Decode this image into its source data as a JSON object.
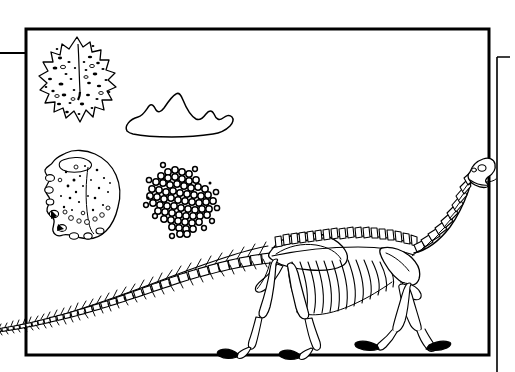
{
  "page": {
    "kind": "scientific-line-illustration",
    "background_color": "#ffffff",
    "ink_color": "#000000",
    "width": 515,
    "height": 372,
    "caption_text": "",
    "labels": []
  },
  "frame": {
    "name": "illustration-border",
    "style": "rectangular black rule",
    "left": 26,
    "top": 29,
    "right": 489,
    "bottom": 355,
    "stroke_width": 3,
    "color": "#000000"
  },
  "secondary_frame": {
    "name": "page-edge-rule",
    "description": "thin vertical rule offset to the right of the main frame",
    "x": 497,
    "top": 57,
    "bottom": 372,
    "stroke_width": 1.5,
    "color": "#000000"
  },
  "horizontal_rule": {
    "name": "left-margin-rule",
    "description": "horizontal rule running from the left page edge to the frame border",
    "x_start": 0,
    "x_end": 26,
    "y": 53,
    "stroke_width": 2,
    "color": "#000000"
  },
  "specimens": [
    {
      "id": "specimen-porous-plate",
      "label": "",
      "description": "diamond-shaped spiky plate with dense dark pores and a central ridge line",
      "center_x": 77,
      "center_y": 80,
      "width": 80,
      "height": 88,
      "texture": "dark speckles"
    },
    {
      "id": "specimen-ridge-outline",
      "label": "",
      "description": "blank peaked ridge / tooth crown outline, no interior texture",
      "center_x": 176,
      "center_y": 117,
      "width": 102,
      "height": 44,
      "texture": "none"
    },
    {
      "id": "specimen-rock-fragment",
      "label": "",
      "description": "irregular bone or rock fragment with knobbly left margin, fine stipple and small vacuoles",
      "center_x": 80,
      "center_y": 195,
      "width": 84,
      "height": 92,
      "texture": "stipple and circles"
    },
    {
      "id": "specimen-ooid-cluster",
      "label": "",
      "description": "dense rounded cluster of small circles resembling a mass of eggs or ooids",
      "center_x": 185,
      "center_y": 202,
      "width": 74,
      "height": 68,
      "texture": "packed circles"
    }
  ],
  "skeleton": {
    "name": "sauropod-skeleton",
    "label": "",
    "description": "lateral view of a long-necked sauropod dinosaur skeleton walking to the right",
    "orientation": "facing right",
    "parts": [
      "skull",
      "cervical-vertebrae",
      "dorsal-vertebrae",
      "caudal-vertebrae",
      "ribs",
      "scapula",
      "pelvis",
      "forelimb",
      "hindlimb",
      "manus",
      "pes"
    ],
    "skull_x": 478,
    "skull_y": 166,
    "tail_tip_x": -10,
    "tail_tip_y": 331,
    "crosses_left_border": true,
    "touches_right_border": true
  },
  "colors": {
    "ink": "#000000",
    "paper": "#ffffff",
    "outer_margin": "#ffffff"
  }
}
